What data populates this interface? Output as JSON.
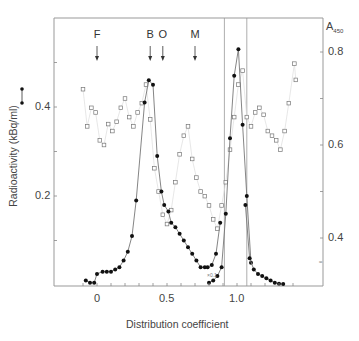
{
  "chart_data": {
    "type": "line",
    "title": "",
    "xlabel": "Distribution coefficient",
    "ylabel": "Radioactivity (kBq/ml)",
    "y2label": "A450",
    "x_ticks": [
      "0",
      "0.5",
      "1.0"
    ],
    "y_ticks": [
      "0.2",
      "0.4"
    ],
    "y2_ticks": [
      "0.4",
      "0.6",
      "0.8"
    ],
    "xlim": [
      -0.15,
      1.45
    ],
    "ylim": [
      0,
      0.6
    ],
    "y2lim": [
      0.3,
      0.88
    ],
    "grid": false,
    "markers": [
      {
        "label": "F",
        "x": 0.0
      },
      {
        "label": "B",
        "x": 0.38
      },
      {
        "label": "O",
        "x": 0.47
      },
      {
        "label": "M",
        "x": 0.7
      }
    ],
    "vertical_lines": [
      0.91,
      1.07
    ],
    "annotation": "×0.1",
    "legend": [
      {
        "name": "Radioactivity",
        "symbol": "filled-circle",
        "axis": "left"
      },
      {
        "name": "A450",
        "symbol": "open-square",
        "axis": "right"
      }
    ],
    "series": [
      {
        "name": "Radioactivity (kBq/ml)",
        "symbol": "filled-circle",
        "axis": "left",
        "x": [
          -0.08,
          -0.05,
          -0.02,
          0.0,
          0.04,
          0.07,
          0.1,
          0.13,
          0.16,
          0.19,
          0.22,
          0.25,
          0.28,
          0.34,
          0.37,
          0.4,
          0.43,
          0.46,
          0.48,
          0.51,
          0.53,
          0.56,
          0.59,
          0.62,
          0.65,
          0.68,
          0.71,
          0.74,
          0.77,
          0.79,
          0.82,
          0.85,
          0.88
        ],
        "y": [
          0.01,
          0.005,
          0.005,
          0.025,
          0.03,
          0.03,
          0.03,
          0.035,
          0.04,
          0.055,
          0.075,
          0.11,
          0.19,
          0.41,
          0.46,
          0.45,
          0.29,
          0.21,
          0.18,
          0.165,
          0.14,
          0.13,
          0.115,
          0.1,
          0.085,
          0.07,
          0.055,
          0.04,
          0.04,
          0.04,
          0.045,
          0.07,
          0.14
        ]
      },
      {
        "name": "Radioactivity ×0.1 (scaled peak)",
        "symbol": "filled-circle",
        "axis": "left",
        "x": [
          0.8,
          0.83,
          0.86,
          0.89,
          0.92,
          0.95,
          0.98,
          1.01,
          1.04,
          1.07,
          1.1
        ],
        "y": [
          0.005,
          0.01,
          0.02,
          0.04,
          0.16,
          0.33,
          0.47,
          0.53,
          0.36,
          0.2,
          0.05
        ]
      },
      {
        "name": "Radioactivity (tail)",
        "symbol": "filled-circle",
        "axis": "left",
        "x": [
          1.06,
          1.09,
          1.12,
          1.15,
          1.18,
          1.21,
          1.24,
          1.27,
          1.3,
          1.33
        ],
        "y": [
          0.18,
          0.06,
          0.035,
          0.025,
          0.02,
          0.015,
          0.01,
          0.005,
          0.003,
          0.002
        ]
      },
      {
        "name": "A450",
        "symbol": "open-square",
        "axis": "right",
        "x": [
          -0.1,
          -0.07,
          -0.04,
          -0.01,
          0.02,
          0.05,
          0.08,
          0.11,
          0.14,
          0.17,
          0.2,
          0.23,
          0.26,
          0.29,
          0.32,
          0.35,
          0.38,
          0.41,
          0.44,
          0.47,
          0.5,
          0.53,
          0.56,
          0.59,
          0.62,
          0.65,
          0.68,
          0.71,
          0.74,
          0.77,
          0.8,
          0.83,
          0.86,
          0.89,
          0.92,
          0.95,
          0.98,
          1.01,
          1.04,
          1.07,
          1.1,
          1.13,
          1.16,
          1.19,
          1.22,
          1.25,
          1.28,
          1.31,
          1.34,
          1.37,
          1.41,
          1.42
        ],
        "y": [
          0.72,
          0.64,
          0.68,
          0.67,
          0.61,
          0.6,
          0.645,
          0.63,
          0.65,
          0.68,
          0.7,
          0.66,
          0.64,
          0.67,
          0.69,
          0.73,
          0.655,
          0.55,
          0.5,
          0.45,
          0.43,
          0.46,
          0.52,
          0.58,
          0.62,
          0.64,
          0.57,
          0.53,
          0.5,
          0.49,
          0.47,
          0.44,
          0.42,
          0.47,
          0.52,
          0.59,
          0.66,
          0.73,
          0.76,
          0.66,
          0.64,
          0.67,
          0.68,
          0.665,
          0.63,
          0.62,
          0.61,
          0.59,
          0.63,
          0.69,
          0.775,
          0.74
        ]
      }
    ]
  }
}
